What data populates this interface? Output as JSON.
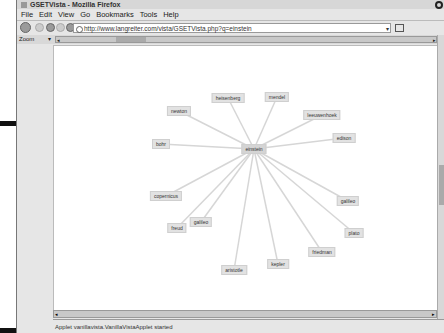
{
  "caption": {
    "figure_label": "-7:",
    "lines": [
      "o's",
      "e-",
      "in",
      "on,",
      "g a",
      "Set",
      "nd",
      "rd",
      "he",
      "f a",
      "sic",
      "up."
    ]
  },
  "window": {
    "title": "GSETVista - Mozilla Firefox",
    "menu": [
      "File",
      "Edit",
      "View",
      "Go",
      "Bookmarks",
      "Tools",
      "Help"
    ],
    "url": "http://www.langreiter.com/vista/GSETVista.php?q=einstein",
    "zoom_label": "Zoom",
    "status": "Applet vanillavista.VanillaVistaApplet started"
  },
  "graph": {
    "center": {
      "label": "einstein",
      "x": 200,
      "y": 103
    },
    "nodes": [
      {
        "label": "heisenberg",
        "x": 174,
        "y": 52
      },
      {
        "label": "mendel",
        "x": 223,
        "y": 51
      },
      {
        "label": "leeuwenhoek",
        "x": 268,
        "y": 69
      },
      {
        "label": "newton",
        "x": 125,
        "y": 65
      },
      {
        "label": "bohr",
        "x": 107,
        "y": 98
      },
      {
        "label": "edison",
        "x": 290,
        "y": 92
      },
      {
        "label": "copernicus",
        "x": 112,
        "y": 150
      },
      {
        "label": "galileo",
        "x": 294,
        "y": 155
      },
      {
        "label": "plato",
        "x": 300,
        "y": 187
      },
      {
        "label": "freud",
        "x": 123,
        "y": 182
      },
      {
        "label": "galileo",
        "x": 147,
        "y": 176
      },
      {
        "label": "friedman",
        "x": 268,
        "y": 206
      },
      {
        "label": "aristotle",
        "x": 180,
        "y": 224
      },
      {
        "label": "kepler",
        "x": 224,
        "y": 218
      }
    ]
  }
}
